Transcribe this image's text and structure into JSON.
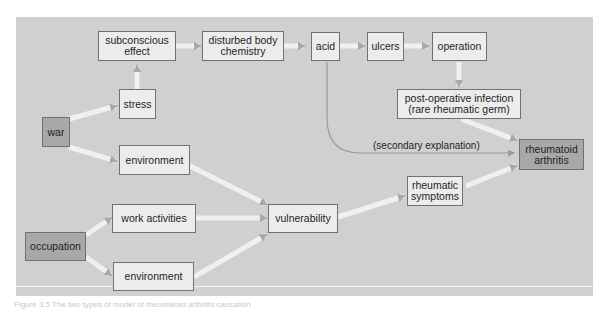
{
  "diagram": {
    "nodes": {
      "subconscious_effect": "subconscious\neffect",
      "disturbed_body_chemistry": "disturbed body\nchemistry",
      "acid": "acid",
      "ulcers": "ulcers",
      "operation": "operation",
      "post_operative_infection": "post-operative infection\n(rare rheumatic germ)",
      "stress": "stress",
      "war": "war",
      "environment_war": "environment",
      "rheumatoid_arthritis": "rheumatoid\narthritis",
      "rheumatic_symptoms": "rheumatic\nsymptoms",
      "work_activities": "work activities",
      "vulnerability": "vulnerability",
      "occupation": "occupation",
      "environment_occupation": "environment"
    },
    "edge_labels": {
      "secondary_explanation": "(secondary explanation)"
    },
    "colors": {
      "panel": "#d0d0d0",
      "node_light": "#ececec",
      "node_dark": "#a8a8a8",
      "arrow": "#b4b4b4"
    }
  },
  "caption": "Figure 3.5 The two types of model of rheumatoid arthritis causation"
}
